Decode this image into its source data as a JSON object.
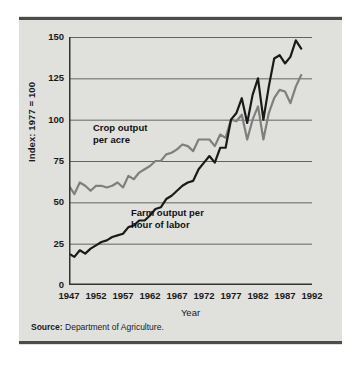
{
  "figure": {
    "background_color": "#e0e0dd",
    "rule_color": "#4c4c4c"
  },
  "source": {
    "label": "Source:",
    "text": " Department of Agriculture."
  },
  "annotations": {
    "crop_line1": "Crop output",
    "crop_line2": "per acre",
    "farm_line1": "Farm output per",
    "farm_line2": "hour of labor"
  },
  "chart_data": {
    "type": "line",
    "title": "",
    "subtitle": "",
    "xlabel": "Year",
    "ylabel": "Index: 1977 = 100",
    "xlim": [
      1947,
      1992
    ],
    "ylim": [
      0,
      150
    ],
    "yticks": [
      0,
      25,
      50,
      75,
      100,
      125,
      150
    ],
    "xticks": [
      1947,
      1952,
      1957,
      1962,
      1967,
      1972,
      1977,
      1982,
      1987,
      1992
    ],
    "grid": "horizontal",
    "legend": "in-plot annotations",
    "colors": {
      "crop_output_per_acre": "#7f7f7f",
      "farm_output_per_hour": "#1a1a1a",
      "gridline": "#555555",
      "axis": "#333333"
    },
    "x": [
      1947,
      1948,
      1949,
      1950,
      1951,
      1952,
      1953,
      1954,
      1955,
      1956,
      1957,
      1958,
      1959,
      1960,
      1961,
      1962,
      1963,
      1964,
      1965,
      1966,
      1967,
      1968,
      1969,
      1970,
      1971,
      1972,
      1973,
      1974,
      1975,
      1976,
      1977,
      1978,
      1979,
      1980,
      1981,
      1982,
      1983,
      1984,
      1985,
      1986,
      1987,
      1988,
      1989,
      1990
    ],
    "series": [
      {
        "name": "Crop output per acre",
        "color": "#7f7f7f",
        "values": [
          60,
          55,
          62,
          60,
          57,
          60,
          60,
          59,
          60,
          62,
          59,
          66,
          64,
          68,
          70,
          72,
          75,
          75,
          79,
          80,
          82,
          85,
          84,
          81,
          88,
          88,
          88,
          84,
          91,
          89,
          100,
          99,
          103,
          88,
          100,
          108,
          88,
          104,
          113,
          118,
          117,
          110,
          120,
          127
        ]
      },
      {
        "name": "Farm output per hour of labor",
        "color": "#1a1a1a",
        "values": [
          19,
          17,
          21,
          19,
          22,
          24,
          26,
          27,
          29,
          30,
          31,
          35,
          36,
          39,
          39,
          42,
          46,
          47,
          52,
          54,
          57,
          60,
          62,
          63,
          70,
          74,
          78,
          74,
          83,
          83,
          100,
          104,
          113,
          98,
          115,
          125,
          100,
          120,
          137,
          139,
          134,
          138,
          148,
          143
        ]
      }
    ]
  }
}
